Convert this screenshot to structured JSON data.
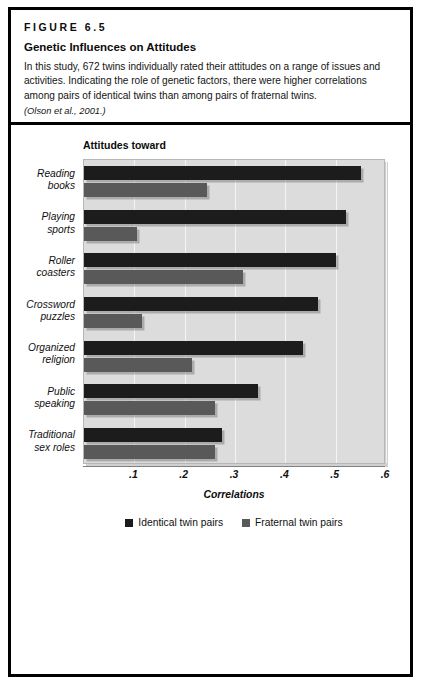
{
  "figure": {
    "label": "FIGURE 6.5",
    "title": "Genetic Influences on Attitudes",
    "description": "In this study, 672 twins individually rated their attitudes on a range of issues and activities. Indicating the role of genetic factors, there were higher correlations among pairs of identical twins than among pairs of fraternal twins.",
    "citation": "(Olson et al., 2001.)"
  },
  "chart_heading": "Attitudes toward",
  "colors": {
    "identical": "#1c1c1c",
    "fraternal": "#595959",
    "plot_background": "#dcdcdc",
    "gridline": "#f4f4f4",
    "frame": "#000000"
  },
  "chart_data": {
    "type": "bar",
    "orientation": "horizontal",
    "title": "Attitudes toward",
    "xlabel": "Correlations",
    "ylabel": "",
    "xlim": [
      0,
      0.6
    ],
    "xticks": [
      0.1,
      0.2,
      0.3,
      0.4,
      0.5,
      0.6
    ],
    "xtick_labels": [
      ".1",
      ".2",
      ".3",
      ".4",
      ".5",
      ".6"
    ],
    "grid": true,
    "legend_position": "bottom",
    "categories": [
      "Reading books",
      "Playing sports",
      "Roller coasters",
      "Crossword puzzles",
      "Organized religion",
      "Public speaking",
      "Traditional sex roles"
    ],
    "category_lines": [
      [
        "Reading",
        "books"
      ],
      [
        "Playing",
        "sports"
      ],
      [
        "Roller",
        "coasters"
      ],
      [
        "Crossword",
        "puzzles"
      ],
      [
        "Organized",
        "religion"
      ],
      [
        "Public",
        "speaking"
      ],
      [
        "Traditional",
        "sex roles"
      ]
    ],
    "series": [
      {
        "name": "Identical twin pairs",
        "color": "#1c1c1c",
        "values": [
          0.55,
          0.52,
          0.5,
          0.465,
          0.435,
          0.345,
          0.275
        ]
      },
      {
        "name": "Fraternal twin pairs",
        "color": "#595959",
        "values": [
          0.245,
          0.105,
          0.315,
          0.115,
          0.215,
          0.26,
          0.26
        ]
      }
    ]
  },
  "legend": [
    {
      "label": "Identical twin pairs",
      "color": "#1c1c1c"
    },
    {
      "label": "Fraternal twin pairs",
      "color": "#595959"
    }
  ]
}
